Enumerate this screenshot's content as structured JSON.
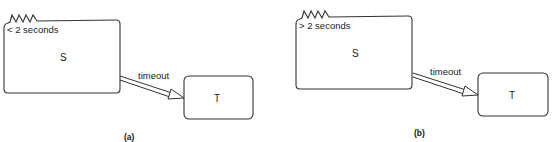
{
  "diagrams": [
    {
      "id": "a",
      "caption": "(a)",
      "source_state": {
        "label": "S",
        "time_annotation": "< 2 seconds"
      },
      "target_state": {
        "label": "T"
      },
      "transition": {
        "label": "timeout"
      }
    },
    {
      "id": "b",
      "caption": "(b)",
      "source_state": {
        "label": "S",
        "time_annotation": "> 2 seconds"
      },
      "target_state": {
        "label": "T"
      },
      "transition": {
        "label": "timeout"
      }
    }
  ],
  "colors": {
    "stroke": "#333333",
    "text": "#222222",
    "background": "#ffffff"
  }
}
